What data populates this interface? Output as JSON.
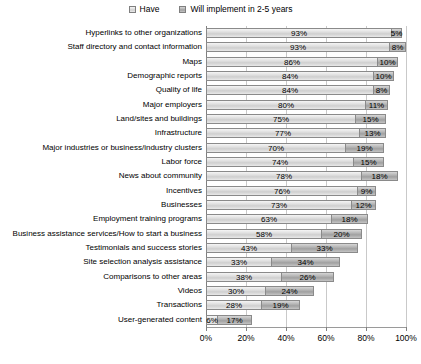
{
  "legend": {
    "items": [
      {
        "label": "Have",
        "swatch": "light-gray"
      },
      {
        "label": "Will implement in 2-5 years",
        "swatch": "medium-gray"
      }
    ]
  },
  "chart_data": {
    "type": "bar",
    "orientation": "horizontal",
    "stacked": true,
    "title": "",
    "xlabel": "",
    "ylabel": "",
    "categories": [
      "Hyperlinks to other organizations",
      "Staff directory and contact information",
      "Maps",
      "Demographic reports",
      "Quality of life",
      "Major employers",
      "Land/sites and buildings",
      "Infrastructure",
      "Major industries or business/industry clusters",
      "Labor force",
      "News about community",
      "Incentives",
      "Businesses",
      "Employment training programs",
      "Business assistance services/How to start a business",
      "Testimonials and success stories",
      "Site selection analysis assistance",
      "Comparisons to other areas",
      "Videos",
      "Transactions",
      "User-generated content"
    ],
    "series": [
      {
        "name": "Have",
        "values": [
          93,
          93,
          86,
          84,
          84,
          80,
          75,
          77,
          70,
          74,
          78,
          76,
          73,
          63,
          58,
          43,
          33,
          38,
          30,
          28,
          6
        ]
      },
      {
        "name": "Will implement in 2-5 years",
        "values": [
          5,
          8,
          10,
          10,
          8,
          11,
          15,
          13,
          19,
          15,
          18,
          9,
          12,
          18,
          20,
          33,
          34,
          26,
          24,
          19,
          17
        ]
      }
    ],
    "value_label_format": "percent",
    "xlim": [
      0,
      100
    ],
    "xticks": [
      "0%",
      "20%",
      "40%",
      "60%",
      "80%",
      "100%"
    ],
    "grid": true,
    "legend_position": "top",
    "colors": {
      "have_fill": "#dedede",
      "implement_fill": "#b0b0b0",
      "bar_border": "#8a8a8a",
      "gridline": "#c9c9c9",
      "axis": "#808080",
      "label_text": "#000000",
      "background": "#ffffff"
    }
  }
}
